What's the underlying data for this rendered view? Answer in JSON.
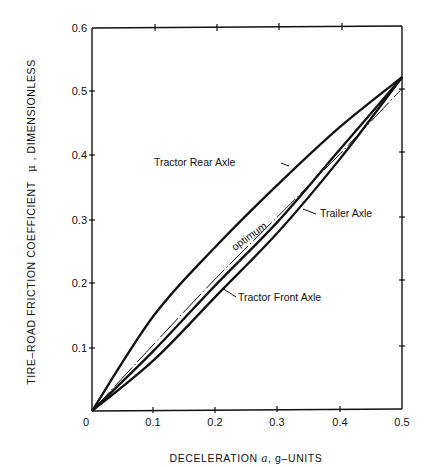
{
  "chart_data": {
    "type": "line",
    "title": "",
    "xlabel": "DECELERATION a, g-UNITS",
    "ylabel": "TIRE-ROAD FRICTION COEFFICIENT μ, DIMENSIONLESS",
    "xlim": [
      0,
      0.5
    ],
    "ylim": [
      0,
      0.6
    ],
    "grid": false,
    "legend": "none (curves labeled directly)",
    "x_ticks": [
      "0.1",
      "0.2",
      "0.3",
      "0.4",
      "0.5"
    ],
    "y_ticks": [
      "0.1",
      "0.2",
      "0.3",
      "0.4",
      "0.5",
      "0.6"
    ],
    "origin_label": "0",
    "x": [
      0,
      0.1,
      0.2,
      0.3,
      0.4,
      0.5
    ],
    "series": [
      {
        "name": "Tractor Rear Axle",
        "style": "solid-thick",
        "values": [
          0,
          0.15,
          0.258,
          0.355,
          0.445,
          0.523
        ]
      },
      {
        "name": "optimum",
        "style": "dash-dot-thin",
        "values": [
          0,
          0.105,
          0.208,
          0.305,
          0.403,
          0.505
        ]
      },
      {
        "name": "Tractor Front Axle",
        "style": "solid-thick",
        "values": [
          0,
          0.095,
          0.198,
          0.297,
          0.41,
          0.523
        ]
      },
      {
        "name": "Trailer Axle",
        "style": "solid-thick",
        "values": [
          0,
          0.08,
          0.18,
          0.28,
          0.395,
          0.523
        ]
      }
    ],
    "annotations": [
      {
        "text": "Tractor Rear Axle",
        "x": 0.17,
        "y": 0.41,
        "points_to": "Tractor Rear Axle"
      },
      {
        "text": "optimum",
        "x": 0.23,
        "y": 0.25,
        "rotated": true,
        "points_to": "optimum"
      },
      {
        "text": "Trailer Axle",
        "x": 0.35,
        "y": 0.32,
        "points_to": "Trailer Axle"
      },
      {
        "text": "Tractor Front Axle",
        "x": 0.24,
        "y": 0.17,
        "points_to": "Tractor Front Axle"
      }
    ]
  },
  "labels": {
    "y_title_main": "TIRE–ROAD FRICTION COEFFICIENT",
    "y_title_symbol": "μ",
    "y_title_tail": ", DIMENSIONLESS",
    "x_title_main": "DECELERATION",
    "x_title_symbol": "a",
    "x_title_tail": ", g–UNITS",
    "rear": "Tractor Rear Axle",
    "optimum": "optimum",
    "trailer": "Trailer Axle",
    "front": "Tractor Front Axle",
    "origin": "0",
    "xt1": "0.1",
    "xt2": "0.2",
    "xt3": "0.3",
    "xt4": "0.4",
    "xt5": "0.5",
    "yt1": "0.1",
    "yt2": "0.2",
    "yt3": "0.3",
    "yt4": "0.4",
    "yt5": "0.5",
    "yt6": "0.6"
  }
}
